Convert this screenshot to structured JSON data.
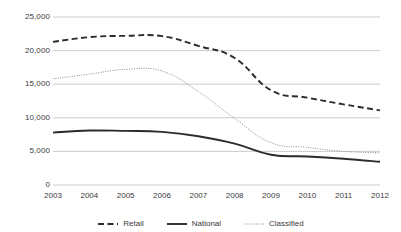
{
  "chart_data": {
    "type": "line",
    "title": "",
    "xlabel": "",
    "ylabel": "",
    "categories": [
      "2003",
      "2004",
      "2005",
      "2006",
      "2007",
      "2008",
      "2009",
      "2010",
      "2011",
      "2012"
    ],
    "x": [
      2003,
      2004,
      2005,
      2006,
      2007,
      2008,
      2009,
      2010,
      2011,
      2012
    ],
    "ylim": [
      0,
      25000
    ],
    "xlim": [
      2003,
      2012
    ],
    "yticks": [
      0,
      5000,
      10000,
      15000,
      20000,
      25000
    ],
    "ytick_labels": [
      "0",
      "5,000",
      "10,000",
      "15,000",
      "20,000",
      "25,000"
    ],
    "grid": "horizontal",
    "legend_position": "bottom",
    "series": [
      {
        "name": "Retail",
        "style": "dashed",
        "color": "#2b2b2b",
        "values": [
          21300,
          22000,
          22200,
          22150,
          20700,
          18900,
          14100,
          13000,
          12000,
          11100
        ]
      },
      {
        "name": "National",
        "style": "solid",
        "color": "#2b2b2b",
        "values": [
          7800,
          8100,
          8050,
          7900,
          7250,
          6150,
          4500,
          4250,
          3900,
          3450
        ]
      },
      {
        "name": "Classified",
        "style": "dotted",
        "color": "#8c8c8c",
        "values": [
          15800,
          16500,
          17200,
          16950,
          13900,
          9900,
          6300,
          5600,
          5000,
          4800
        ]
      }
    ]
  },
  "legend": {
    "items": [
      {
        "label": "Retail",
        "style": "dashed",
        "color": "#2b2b2b"
      },
      {
        "label": "National",
        "style": "solid",
        "color": "#2b2b2b"
      },
      {
        "label": "Classified",
        "style": "dotted",
        "color": "#8c8c8c"
      }
    ]
  },
  "axis": {
    "y_labels": [
      "25,000",
      "20,000",
      "15,000",
      "10,000",
      "5,000",
      "0"
    ],
    "x_labels": [
      "2003",
      "2004",
      "2005",
      "2006",
      "2007",
      "2008",
      "2009",
      "2010",
      "2011",
      "2012"
    ]
  },
  "colors": {
    "gridline": "#bfbfbf",
    "axis_text": "#3a3a3a",
    "retail": "#2b2b2b",
    "national": "#2b2b2b",
    "classified": "#8c8c8c",
    "background": "#ffffff"
  }
}
